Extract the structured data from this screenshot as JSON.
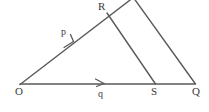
{
  "figure": {
    "type": "geometry-diagram",
    "background_color": "#ffffff",
    "ink_color": "#555555",
    "text_color": "#3a3a3a",
    "width": 209,
    "height": 112,
    "vertices": [
      {
        "id": "O",
        "label": "O",
        "x": 20,
        "y": 84
      },
      {
        "id": "Q",
        "label": "Q",
        "x": 195,
        "y": 84
      },
      {
        "id": "S",
        "label": "S",
        "x": 155,
        "y": 84
      },
      {
        "id": "R",
        "label": "R",
        "x": 107,
        "y": 13
      }
    ],
    "segments": [
      {
        "id": "base-OQ",
        "from": "O",
        "to": "Q",
        "x1": 20,
        "y1": 84,
        "x2": 195,
        "y2": 84
      },
      {
        "id": "side-O-apex",
        "from": "O",
        "to": "apex",
        "x1": 20,
        "y1": 84,
        "x2": 133,
        "y2": -2
      },
      {
        "id": "side-apex-Q",
        "from": "apex",
        "to": "Q",
        "x1": 133,
        "y1": -2,
        "x2": 195,
        "y2": 84
      },
      {
        "id": "cevian-RS",
        "from": "R",
        "to": "S",
        "x1": 107,
        "y1": 13,
        "x2": 155,
        "y2": 84
      }
    ],
    "vectors": [
      {
        "id": "p",
        "label": "p",
        "along": "O-R",
        "arrow_tip_x": 72,
        "arrow_tip_y": 45,
        "label_x": 61,
        "label_y": 27
      },
      {
        "id": "q",
        "label": "q",
        "along": "O-S",
        "arrow_tip_x": 103,
        "arrow_tip_y": 84,
        "label_x": 98,
        "label_y": 89
      }
    ]
  }
}
